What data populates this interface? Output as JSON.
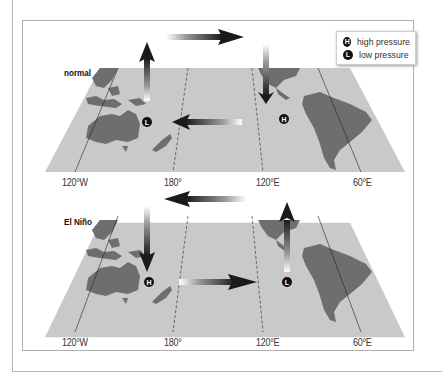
{
  "legend": {
    "items": [
      {
        "symbol": "H",
        "label": "high pressure"
      },
      {
        "symbol": "L",
        "label": "low pressure"
      }
    ]
  },
  "panels": [
    {
      "title": "normal",
      "longitudes": [
        "120°W",
        "180°",
        "120°E",
        "60°E"
      ],
      "pressure_centers": [
        {
          "symbol": "L",
          "location": "western Pacific near Australia"
        },
        {
          "symbol": "H",
          "location": "eastern Pacific near South America"
        }
      ],
      "arrows": [
        "rising air over western Pacific",
        "eastward flow aloft",
        "sinking air over eastern Pacific",
        "westward surface trade winds"
      ]
    },
    {
      "title": "El Niño",
      "longitudes": [
        "120°W",
        "180°",
        "120°E",
        "60°E"
      ],
      "pressure_centers": [
        {
          "symbol": "H",
          "location": "western Pacific near Australia"
        },
        {
          "symbol": "L",
          "location": "eastern Pacific near South America"
        }
      ],
      "arrows": [
        "sinking air over western Pacific",
        "westward flow aloft",
        "rising air over eastern Pacific",
        "eastward surface flow"
      ]
    }
  ],
  "colors": {
    "ocean": "#c9c9c9",
    "land": "#6e6e6e",
    "arrow": "#1a1a1a",
    "badge": "#111111"
  }
}
